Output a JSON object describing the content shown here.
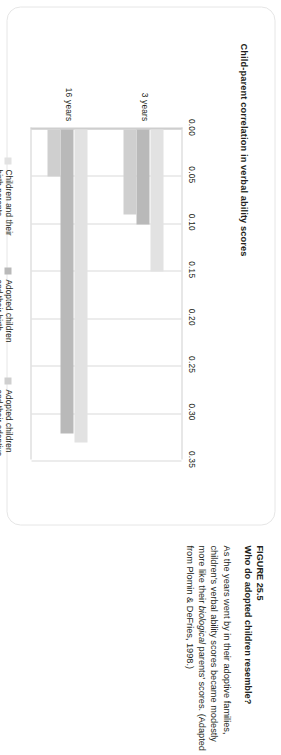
{
  "figure": {
    "label": "FIGURE 25.5",
    "title": "Who do adopted children resemble?",
    "body_part1": "As the years went by in their adoptive families, children’s verbal ability scores became modestly more like their ",
    "body_italic": "biological",
    "body_part2": " parents’ scores. (Adapted from Plomin & DeFries, 1998.)"
  },
  "chart_data": {
    "type": "bar",
    "orientation": "horizontal",
    "title": "",
    "xlabel": "Child-parent correlation in verbal ability scores",
    "ylabel": "",
    "categories": [
      "3 years",
      "16 years"
    ],
    "series": [
      {
        "name": "Children and their birth parents",
        "color": "#e2e2e2",
        "values": [
          0.15,
          0.33
        ]
      },
      {
        "name": "Adopted children and their birth parents",
        "color": "#b9b9b9",
        "values": [
          0.1,
          0.32
        ]
      },
      {
        "name": "Adopted children and their adoptive parents",
        "color": "#cfcfcf",
        "values": [
          0.09,
          0.05
        ]
      }
    ],
    "xlim": [
      0.0,
      0.35
    ],
    "xticks": [
      "0.00",
      "0.05",
      "0.10",
      "0.15",
      "0.20",
      "0.25",
      "0.30",
      "0.35"
    ],
    "xtick_values": [
      0.0,
      0.05,
      0.1,
      0.15,
      0.2,
      0.25,
      0.3,
      0.35
    ],
    "grid": true,
    "legend_position": "bottom"
  }
}
